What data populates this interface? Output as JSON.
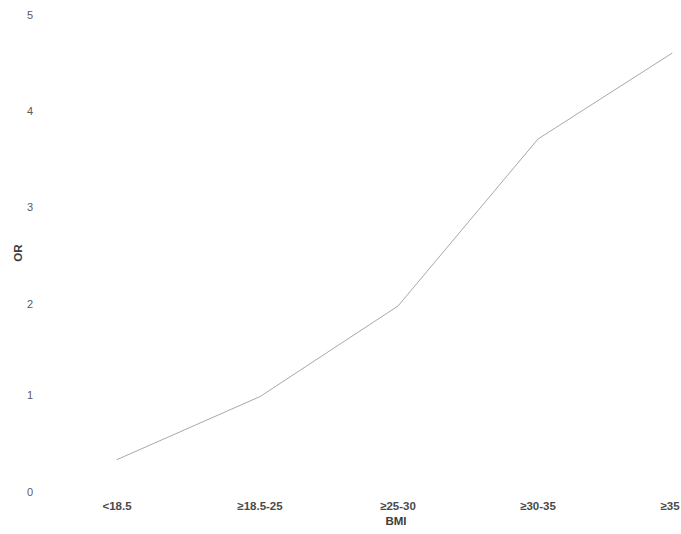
{
  "chart_data": {
    "type": "line",
    "title": "",
    "subtitle": "",
    "xlabel": "BMI",
    "ylabel": "OR",
    "categories": [
      "<18.5",
      "≥18.5-25",
      "≥25-30",
      "≥30-35",
      "≥35"
    ],
    "values": [
      0.34,
      1.0,
      1.95,
      3.7,
      4.6
    ],
    "series": [
      {
        "name": "OR",
        "values": [
          0.34,
          1.0,
          1.95,
          3.7,
          4.6
        ]
      }
    ],
    "ylim": [
      0,
      5
    ],
    "yticks": [
      "0",
      "1",
      "2",
      "3",
      "4",
      "5"
    ],
    "ytick_values": [
      0,
      1,
      2,
      3,
      4,
      5
    ],
    "grid": false,
    "axis_lines": false,
    "markers": false,
    "legend": false,
    "legend_position": "none",
    "line_color": "#a8a8a8",
    "line_width": 1,
    "background_color": "#ffffff",
    "text_color": "#4a4a4a"
  },
  "axes": {
    "y_title": "OR",
    "x_title": "BMI"
  }
}
